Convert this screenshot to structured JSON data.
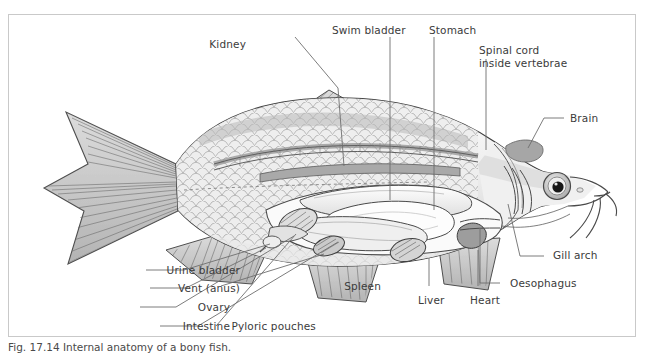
{
  "figure": {
    "domain": "anatomical-illustration",
    "caption": "Fig. 17.14 Internal anatomy of a bony fish.",
    "frame_color": "#c9c9c9",
    "background_color": "#ffffff",
    "label_color": "#3b3b3b",
    "leader_color": "#6e6e6e",
    "artwork_palette": {
      "body_fill": "#f2f2f2",
      "scale_fill": "#ececec",
      "scale_stroke": "#9a9a9a",
      "fin_fill": "#cfcfcf",
      "fin_ray": "#6a6a6a",
      "organ_light": "#fbfbfb",
      "organ_mid": "#d8d8d8",
      "organ_dark": "#9b9b9b",
      "outline": "#4a4a4a",
      "eye_pupil": "#1a1a1a"
    }
  },
  "labels": [
    {
      "id": "kidney",
      "text": "Kidney"
    },
    {
      "id": "swim-bladder",
      "text": "Swim bladder"
    },
    {
      "id": "stomach",
      "text": "Stomach"
    },
    {
      "id": "spinal-cord",
      "text": "Spinal cord\ninside vertebrae"
    },
    {
      "id": "brain",
      "text": "Brain"
    },
    {
      "id": "gill-arch",
      "text": "Gill arch"
    },
    {
      "id": "oesophagus",
      "text": "Oesophagus"
    },
    {
      "id": "heart",
      "text": "Heart"
    },
    {
      "id": "liver",
      "text": "Liver"
    },
    {
      "id": "spleen",
      "text": "Spleen"
    },
    {
      "id": "pyloric",
      "text": "Pyloric pouches"
    },
    {
      "id": "intestine",
      "text": "Intestine"
    },
    {
      "id": "ovary",
      "text": "Ovary"
    },
    {
      "id": "vent",
      "text": "Vent (anus)"
    },
    {
      "id": "urine-bladder",
      "text": "Urine bladder"
    }
  ]
}
